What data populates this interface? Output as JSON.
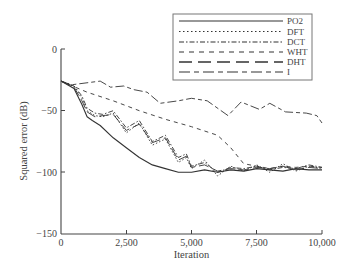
{
  "chart_data": {
    "type": "line",
    "title": "",
    "xlabel": "Iteration",
    "ylabel": "Squared error (dB)",
    "xlim": [
      0,
      10000
    ],
    "ylim": [
      -150,
      0
    ],
    "xticks": [
      0,
      2500,
      5000,
      7500,
      10000
    ],
    "xtick_labels": [
      "0",
      "2,500",
      "5,000",
      "7,500",
      "10,000"
    ],
    "yticks": [
      0,
      -50,
      -100,
      -150
    ],
    "ytick_labels": [
      "0",
      "−50",
      "−100",
      "−150"
    ],
    "grid": false,
    "legend_position": "upper right",
    "series": [
      {
        "name": "PO2",
        "style": "solid",
        "x": [
          0,
          500,
          800,
          1000,
          1200,
          1500,
          2000,
          2500,
          3000,
          3500,
          4000,
          4500,
          5000,
          5500,
          6000,
          6500,
          7000,
          7500,
          8000,
          8500,
          9000,
          9500,
          10000
        ],
        "values": [
          -26,
          -32,
          -45,
          -55,
          -58,
          -62,
          -72,
          -80,
          -88,
          -94,
          -97,
          -100,
          -100,
          -98,
          -100,
          -98,
          -99,
          -97,
          -98,
          -99,
          -97,
          -98,
          -98
        ]
      },
      {
        "name": "DFT",
        "style": "dotted",
        "x": [
          0,
          500,
          800,
          1000,
          1300,
          1600,
          2000,
          2500,
          3000,
          3500,
          4000,
          4500,
          4800,
          5000,
          5500,
          6000,
          6500,
          7000,
          7500,
          8000,
          8500,
          9000,
          9500,
          10000
        ],
        "values": [
          -26,
          -30,
          -40,
          -50,
          -54,
          -55,
          -52,
          -68,
          -60,
          -78,
          -73,
          -92,
          -88,
          -97,
          -90,
          -103,
          -95,
          -99,
          -94,
          -100,
          -93,
          -99,
          -95,
          -97
        ]
      },
      {
        "name": "DCT",
        "style": "dash-dot",
        "x": [
          0,
          500,
          800,
          1000,
          1300,
          1600,
          2000,
          2500,
          3000,
          3500,
          4000,
          4500,
          4800,
          5000,
          5500,
          6000,
          6500,
          7000,
          7500,
          8000,
          8500,
          9000,
          9500,
          10000
        ],
        "values": [
          -26,
          -30,
          -38,
          -48,
          -52,
          -53,
          -50,
          -64,
          -58,
          -75,
          -70,
          -88,
          -85,
          -95,
          -92,
          -100,
          -96,
          -97,
          -95,
          -98,
          -96,
          -97,
          -94,
          -96
        ]
      },
      {
        "name": "WHT",
        "style": "short-dash",
        "x": [
          0,
          1000,
          2000,
          3000,
          4000,
          5000,
          6000,
          6500,
          7000,
          7500,
          8000,
          8500,
          9000,
          9500,
          10000
        ],
        "values": [
          -26,
          -35,
          -42,
          -50,
          -57,
          -63,
          -70,
          -80,
          -93,
          -95,
          -97,
          -95,
          -96,
          -95,
          -96
        ]
      },
      {
        "name": "DHT",
        "style": "long-dash",
        "x": [
          0,
          500,
          800,
          1000,
          1300,
          1600,
          2000,
          2500,
          3000,
          3500,
          4000,
          4500,
          4800,
          5000,
          5500,
          6000,
          6500,
          7000,
          7500,
          8000,
          8500,
          9000,
          9500,
          10000
        ],
        "values": [
          -26,
          -31,
          -42,
          -51,
          -55,
          -54,
          -53,
          -66,
          -61,
          -76,
          -72,
          -90,
          -87,
          -96,
          -94,
          -99,
          -97,
          -98,
          -96,
          -97,
          -95,
          -98,
          -96,
          -97
        ]
      },
      {
        "name": "I",
        "style": "long-short-dash",
        "x": [
          0,
          400,
          1500,
          1900,
          2400,
          2800,
          3300,
          3800,
          4500,
          5000,
          5600,
          6400,
          6900,
          7600,
          8000,
          8600,
          9400,
          9800,
          10000
        ],
        "values": [
          -26,
          -29,
          -26,
          -31,
          -30,
          -33,
          -35,
          -44,
          -42,
          -40,
          -42,
          -54,
          -43,
          -49,
          -44,
          -51,
          -52,
          -54,
          -60
        ]
      }
    ]
  },
  "legend": {
    "items": [
      {
        "label": "PO2"
      },
      {
        "label": "DFT"
      },
      {
        "label": "DCT"
      },
      {
        "label": "WHT"
      },
      {
        "label": "DHT"
      },
      {
        "label": "I"
      }
    ]
  },
  "axes": {
    "x_title": "Iteration",
    "y_title": "Squared error (dB)",
    "x_tick_labels": [
      "0",
      "2,500",
      "5,000",
      "7,500",
      "10,000"
    ],
    "y_tick_labels": [
      "0",
      "−50",
      "−100",
      "−150"
    ]
  },
  "colors": {
    "line": "#333333",
    "axis": "#444444",
    "legend_border": "#777777"
  }
}
